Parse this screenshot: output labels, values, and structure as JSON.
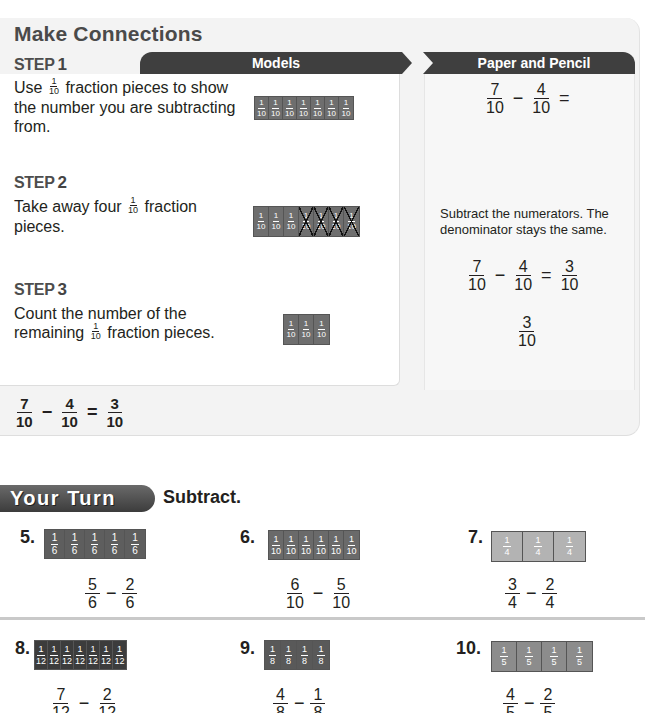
{
  "make_connections": {
    "title": "Make Connections",
    "models_tab": "Models",
    "paper_pencil_tab": "Paper and Pencil",
    "steps": [
      {
        "label": "STEP",
        "number": "1",
        "text_before": "Use",
        "inline_fraction": {
          "n": "1",
          "d": "10"
        },
        "text_after": "fraction pieces to show the number you are subtracting from.",
        "model": {
          "pieces": 7,
          "denominator": "10",
          "crossed": 0
        }
      },
      {
        "label": "STEP",
        "number": "2",
        "text_before": "Take away four",
        "inline_fraction": {
          "n": "1",
          "d": "10"
        },
        "text_after": "fraction pieces.",
        "model": {
          "pieces": 7,
          "denominator": "10",
          "crossed": 4
        }
      },
      {
        "label": "STEP",
        "number": "3",
        "text_before": "Count the number of the remaining",
        "inline_fraction": {
          "n": "1",
          "d": "10"
        },
        "text_after": "fraction pieces.",
        "model": {
          "pieces": 3,
          "denominator": "10",
          "crossed": 0
        }
      }
    ],
    "paper_pencil": {
      "step1": {
        "a": {
          "n": "7",
          "d": "10"
        },
        "op": "−",
        "b": {
          "n": "4",
          "d": "10"
        },
        "eq": "="
      },
      "step2_note": "Subtract the numerators. The denominator stays the same.",
      "step2": {
        "a": {
          "n": "7",
          "d": "10"
        },
        "op": "−",
        "b": {
          "n": "4",
          "d": "10"
        },
        "eq": "=",
        "c": {
          "n": "3",
          "d": "10"
        }
      },
      "step3": {
        "c": {
          "n": "3",
          "d": "10"
        }
      }
    },
    "summary": {
      "a": {
        "n": "7",
        "d": "10"
      },
      "op": "−",
      "b": {
        "n": "4",
        "d": "10"
      },
      "eq": "=",
      "c": {
        "n": "3",
        "d": "10"
      }
    }
  },
  "your_turn": {
    "badge": "Your Turn",
    "instruction": "Subtract.",
    "exercises": [
      {
        "num": "5.",
        "model": {
          "pieces": 5,
          "d": "6",
          "color": "#5e5e5e"
        },
        "a": {
          "n": "5",
          "d": "6"
        },
        "op": "−",
        "b": {
          "n": "2",
          "d": "6"
        }
      },
      {
        "num": "6.",
        "model": {
          "pieces": 6,
          "d": "10",
          "color": "#6a6a6a"
        },
        "a": {
          "n": "6",
          "d": "10"
        },
        "op": "−",
        "b": {
          "n": "5",
          "d": "10"
        }
      },
      {
        "num": "7.",
        "model": {
          "pieces": 3,
          "d": "4",
          "color": "#b3b3b3"
        },
        "a": {
          "n": "3",
          "d": "4"
        },
        "op": "−",
        "b": {
          "n": "2",
          "d": "4"
        }
      },
      {
        "num": "8.",
        "model": {
          "pieces": 7,
          "d": "12",
          "color": "#3c3c3c"
        },
        "a": {
          "n": "7",
          "d": "12"
        },
        "op": "−",
        "b": {
          "n": "2",
          "d": "12"
        }
      },
      {
        "num": "9.",
        "model": {
          "pieces": 4,
          "d": "8",
          "color": "#595959"
        },
        "a": {
          "n": "4",
          "d": "8"
        },
        "op": "−",
        "b": {
          "n": "1",
          "d": "8"
        }
      },
      {
        "num": "10.",
        "model": {
          "pieces": 4,
          "d": "5",
          "color": "#8c8c8c"
        },
        "a": {
          "n": "4",
          "d": "5"
        },
        "op": "−",
        "b": {
          "n": "2",
          "d": "5"
        }
      }
    ]
  },
  "colors": {
    "tab_dark": "#3f3f3f",
    "model_piece": "#6e6e6e",
    "panel_bg": "#f3f3f3"
  }
}
